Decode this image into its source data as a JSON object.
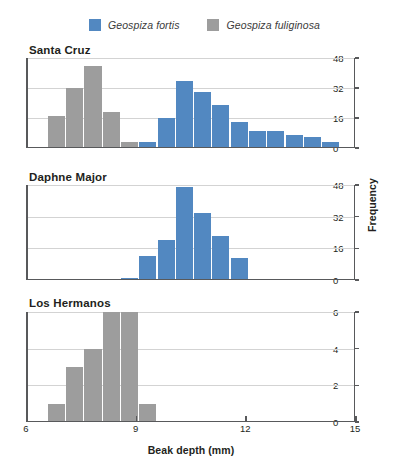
{
  "figure": {
    "xlabel": "Beak depth (mm)",
    "ylabel": "Frequency"
  },
  "legend": {
    "position": "top-center",
    "entries": [
      {
        "label": "Geospiza fortis",
        "color": "#5288c1",
        "species": "fortis"
      },
      {
        "label": "Geospiza fuliginosa",
        "color": "#9d9d9d",
        "species": "fuliginosa"
      }
    ]
  },
  "colors": {
    "fortis_blue": "#5288c1",
    "fuliginosa_gray": "#9d9d9d",
    "axis": "#58595b",
    "gridline": "#d3d3d3",
    "text": "#231f20"
  },
  "xaxis": {
    "min": 6,
    "max": 15,
    "ticks": [
      6,
      9,
      12,
      15
    ],
    "tick_labels": [
      "6",
      "9",
      "12",
      "15"
    ]
  },
  "chart_data": [
    {
      "type": "bar",
      "title": "Santa Cruz",
      "xlabel": "Beak depth (mm)",
      "ylabel": "Frequency",
      "xlim": [
        6,
        15
      ],
      "ylim": [
        0,
        48
      ],
      "yticks": [
        0,
        16,
        32,
        48
      ],
      "ytick_labels": [
        "0",
        "16",
        "32",
        "48"
      ],
      "grid": true,
      "bin_width": 0.5,
      "series": [
        {
          "name": "Geospiza fuliginosa",
          "color": "#9d9d9d",
          "bins": [
            6.6,
            7.1,
            7.6,
            8.1,
            8.6
          ],
          "values": [
            17,
            32,
            44,
            19,
            3
          ]
        },
        {
          "name": "Geospiza fortis",
          "color": "#5288c1",
          "bins": [
            9.1,
            9.6,
            10.1,
            10.6,
            11.1,
            11.6,
            12.1,
            12.6,
            13.1,
            13.6,
            14.1
          ],
          "values": [
            3,
            16,
            36,
            30,
            23,
            14,
            9,
            9,
            7,
            6,
            3
          ]
        }
      ]
    },
    {
      "type": "bar",
      "title": "Daphne Major",
      "xlabel": "Beak depth (mm)",
      "ylabel": "Frequency",
      "xlim": [
        6,
        15
      ],
      "ylim": [
        0,
        48
      ],
      "yticks": [
        0,
        16,
        32,
        48
      ],
      "ytick_labels": [
        "0",
        "16",
        "32",
        "48"
      ],
      "grid": true,
      "bin_width": 0.5,
      "series": [
        {
          "name": "Geospiza fortis",
          "color": "#5288c1",
          "bins": [
            8.6,
            9.1,
            9.6,
            10.1,
            10.6,
            11.1,
            11.6
          ],
          "values": [
            1,
            12,
            20,
            47,
            34,
            22,
            11
          ]
        }
      ]
    },
    {
      "type": "bar",
      "title": "Los Hermanos",
      "xlabel": "Beak depth (mm)",
      "ylabel": "Frequency",
      "xlim": [
        6,
        15
      ],
      "ylim": [
        0,
        6
      ],
      "yticks": [
        0,
        2,
        4,
        6
      ],
      "ytick_labels": [
        "0",
        "2",
        "4",
        "6"
      ],
      "grid": true,
      "bin_width": 0.5,
      "series": [
        {
          "name": "Geospiza fuliginosa",
          "color": "#9d9d9d",
          "bins": [
            6.6,
            7.1,
            7.6,
            8.1,
            8.6,
            9.1
          ],
          "values": [
            1,
            3,
            4,
            6,
            6,
            1
          ]
        }
      ]
    }
  ],
  "panels": [
    {
      "title": "Santa Cruz"
    },
    {
      "title": "Daphne Major"
    },
    {
      "title": "Los Hermanos"
    }
  ]
}
